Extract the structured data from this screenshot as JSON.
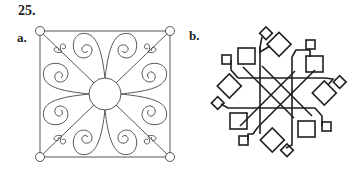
{
  "problem_number": "25.",
  "figures": [
    {
      "label": "a.",
      "name": "scroll-square-ornament",
      "description": "Square frame with corner circles, diagonals, central circle and eight spiral scroll motifs",
      "frame": {
        "x1": 40,
        "y1": 31,
        "x2": 170,
        "y2": 157
      },
      "corner_circle_radius": 4.5,
      "center_circle": {
        "cx": 105,
        "cy": 94,
        "r": 16
      }
    },
    {
      "label": "b.",
      "name": "interlaced-squares-star",
      "description": "Eight-fold interlaced pattern of straight bands with tilted and axis-aligned small squares",
      "center": {
        "cx": 277,
        "cy": 93
      }
    }
  ],
  "colors": {
    "stroke": "#2a2a2a",
    "background": "#ffffff"
  }
}
